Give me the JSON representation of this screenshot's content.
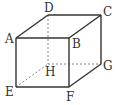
{
  "figure": {
    "type": "cube",
    "colors": {
      "edge": "#333333",
      "hidden_edge": "#777777",
      "background": "#ffffff"
    },
    "vertices": {
      "A": {
        "label": "A",
        "x": 16,
        "y": 38
      },
      "B": {
        "label": "B",
        "x": 69,
        "y": 38
      },
      "C": {
        "label": "C",
        "x": 101,
        "y": 15
      },
      "D": {
        "label": "D",
        "x": 48,
        "y": 15
      },
      "E": {
        "label": "E",
        "x": 16,
        "y": 87
      },
      "F": {
        "label": "F",
        "x": 69,
        "y": 87
      },
      "G": {
        "label": "G",
        "x": 101,
        "y": 64
      },
      "H": {
        "label": "H",
        "x": 48,
        "y": 64
      }
    },
    "visible_edges": [
      "AB",
      "BC",
      "CD",
      "DA",
      "AE",
      "BF",
      "CG",
      "EF",
      "FG"
    ],
    "hidden_edges": [
      "DH",
      "EH",
      "HG"
    ]
  }
}
